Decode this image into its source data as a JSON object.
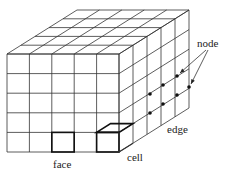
{
  "diagram": {
    "type": "3d-grid-cube",
    "divisions": 5,
    "colors": {
      "line": "#333333",
      "background": "#ffffff",
      "node": "#111111"
    },
    "geometry": {
      "front_x0": 7,
      "front_y0": 54,
      "front_x1": 119,
      "front_y1": 152,
      "depth_dx": 70,
      "depth_dy": -44
    },
    "labels": {
      "node": "node",
      "edge": "edge",
      "face": "face",
      "cell": "cell"
    },
    "nodes": [
      [
        177,
        76
      ],
      [
        189,
        87
      ],
      [
        163,
        85
      ],
      [
        177,
        95
      ],
      [
        150,
        94
      ],
      [
        163,
        104
      ],
      [
        150,
        113
      ]
    ]
  }
}
